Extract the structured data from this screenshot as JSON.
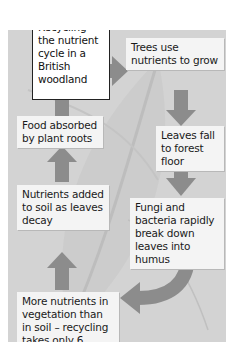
{
  "figure": {
    "number": "Figure 14.6",
    "caption": "Recycling – the nutrient cycle in a British woodland"
  },
  "colors": {
    "panel_background": "#d3d3d3",
    "box_background": "#f4f4f4",
    "arrow": "#8c8c8c",
    "label_border": "#222222"
  },
  "steps": [
    {
      "label": "Trees use nutrients to grow"
    },
    {
      "label": "Leaves fall to forest floor"
    },
    {
      "label": "Fungi and bacteria rapidly break down leaves into humus"
    },
    {
      "label": "More nutrients in vegetation than in soil – recycling takes only 6 months"
    },
    {
      "label": "Nutrients added to soil as leaves decay"
    },
    {
      "label": "Food absorbed by plant roots"
    }
  ]
}
